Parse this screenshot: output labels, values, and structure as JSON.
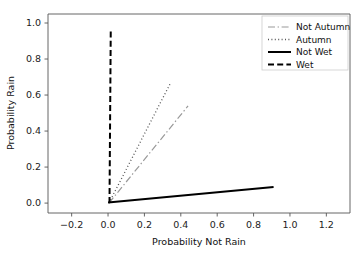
{
  "chart_data": {
    "type": "line",
    "title": "",
    "xlabel": "Probability Not Rain",
    "ylabel": "Probability Rain",
    "xlim": [
      -0.33,
      1.33
    ],
    "ylim": [
      -0.055,
      1.05
    ],
    "xticks": [
      "-0.2",
      "0.0",
      "0.2",
      "0.4",
      "0.6",
      "0.8",
      "1.0",
      "1.2"
    ],
    "xtick_values": [
      -0.2,
      0.0,
      0.2,
      0.4,
      0.6,
      0.8,
      1.0,
      1.2
    ],
    "yticks": [
      "0.0",
      "0.2",
      "0.4",
      "0.6",
      "0.8",
      "1.0"
    ],
    "ytick_values": [
      0.0,
      0.2,
      0.4,
      0.6,
      0.8,
      1.0
    ],
    "grid": false,
    "legend_position": "upper right",
    "series": [
      {
        "name": "Not Autumn",
        "style": "dashdot",
        "color": "#999999",
        "width": 1.2,
        "points": [
          [
            0.005,
            0.0
          ],
          [
            0.44,
            0.54
          ]
        ]
      },
      {
        "name": "Autumn",
        "style": "dotted",
        "color": "#555555",
        "width": 1.3,
        "points": [
          [
            0.005,
            0.0
          ],
          [
            0.34,
            0.66
          ]
        ]
      },
      {
        "name": "Not Wet",
        "style": "solid",
        "color": "#000000",
        "width": 2.0,
        "points": [
          [
            0.0,
            0.003
          ],
          [
            0.91,
            0.09
          ]
        ]
      },
      {
        "name": "Wet",
        "style": "dashed",
        "color": "#000000",
        "width": 2.0,
        "points": [
          [
            0.008,
            0.0
          ],
          [
            0.015,
            0.97
          ]
        ]
      }
    ]
  },
  "axes": {
    "xlabel": "Probability Not Rain",
    "ylabel": "Probability Rain"
  },
  "legend": {
    "entries": [
      {
        "label": "Not Autumn"
      },
      {
        "label": "Autumn"
      },
      {
        "label": "Not Wet"
      },
      {
        "label": "Wet"
      }
    ]
  }
}
